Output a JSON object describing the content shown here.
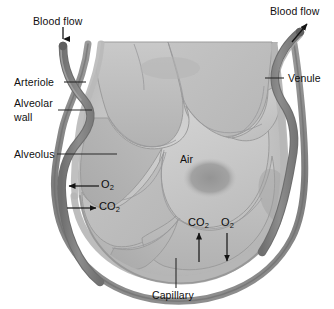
{
  "figure": {
    "width": 334,
    "height": 309,
    "background": "#ffffff"
  },
  "labels": {
    "blood_flow_in": "Blood flow",
    "blood_flow_out": "Blood flow",
    "arteriole": "Arteriole",
    "alveolar_wall_line1": "Alveolar",
    "alveolar_wall_line2": "wall",
    "alveolus": "Alveolus",
    "venule": "Venule",
    "air": "Air",
    "capillary": "Capillary"
  },
  "gases": {
    "o2_symbol": "O",
    "o2_sub": "2",
    "co2_symbol": "CO",
    "co2_sub": "2",
    "left_o2": "O2",
    "left_co2": "CO2",
    "bottom_co2": "CO2",
    "bottom_o2": "O2"
  },
  "arrows": {
    "inflow_direction": "down",
    "outflow_direction": "up-right",
    "left_o2_direction": "left-into-capillary",
    "left_co2_direction": "right-into-alveolus",
    "bottom_co2_direction": "up-into-alveolus",
    "bottom_o2_direction": "down-into-capillary"
  },
  "colors": {
    "vessel_dark": "#858585",
    "vessel_outline": "#6d6d6d",
    "highlight_white": "#ffffff",
    "alveolus_fill": "#bfbfbf",
    "alveolus_fill_light": "#cfcfcf",
    "alveolus_fill_dark": "#a8a8a8",
    "cell_border": "#9a9a9a",
    "air_blob": "#9d9d9d",
    "rim_outer": "#7e7e7e",
    "rim_inner": "#b4b4b4",
    "text": "#101010",
    "leader_line": "#2b2b2b"
  }
}
